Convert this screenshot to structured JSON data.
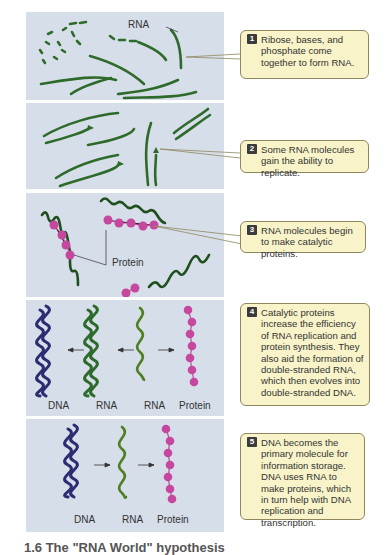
{
  "colors": {
    "panel_bg": "#d6dee9",
    "rna_green": "#2e6b2b",
    "rna_light_green": "#4f7f22",
    "dna_navy": "#2b2c72",
    "protein_magenta": "#c5479e",
    "callout_bg": "#f8f3c9",
    "callout_border": "#8f8660",
    "badge_bg": "#3b3b3b"
  },
  "steps": [
    {
      "number": "1",
      "text": "Ribose, bases, and phosphate come together to form RNA.",
      "labels": {
        "rna": "RNA"
      }
    },
    {
      "number": "2",
      "text": "Some RNA molecules gain the ability to replicate."
    },
    {
      "number": "3",
      "text": "RNA molecules begin to make catalytic proteins.",
      "labels": {
        "protein": "Protein"
      }
    },
    {
      "number": "4",
      "text": "Catalytic proteins increase the efficiency of RNA replication and protein synthesis. They also aid the formation of double-stranded RNA, which then evolves into double-stranded DNA.",
      "labels": [
        "DNA",
        "RNA",
        "RNA",
        "Protein"
      ]
    },
    {
      "number": "5",
      "text": "DNA becomes the primary molecule for information storage. DNA uses RNA to make proteins, which in turn help with DNA replication and transcription.",
      "labels": [
        "DNA",
        "RNA",
        "Protein"
      ]
    }
  ],
  "caption": "1.6 The \"RNA World\" hypothesis"
}
